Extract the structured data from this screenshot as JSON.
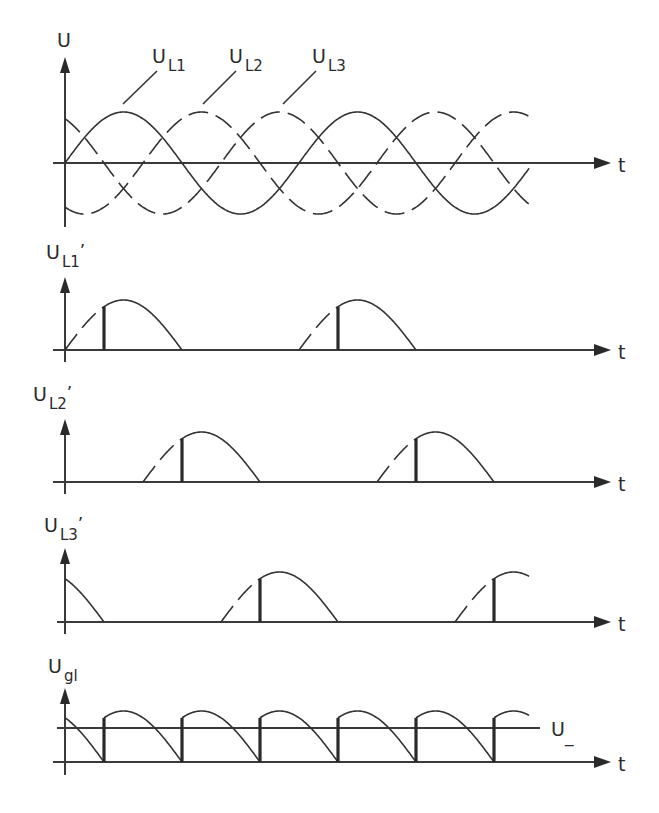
{
  "chart_data": {
    "type": "line",
    "time_axis_label": "t",
    "period_px": 234,
    "origin_x_px": 65,
    "phase_shift_deg": [
      0,
      120,
      240
    ],
    "firing_angle_deg": 60,
    "panels": [
      {
        "id": "phase-voltages",
        "ylabel": "U",
        "series": [
          {
            "name": "U_L1",
            "label_main": "U",
            "label_sub": "L1",
            "style": "solid",
            "shift_deg": 0
          },
          {
            "name": "U_L2",
            "label_main": "U",
            "label_sub": "L2",
            "style": "dashed",
            "shift_deg": 120
          },
          {
            "name": "U_L3",
            "label_main": "U",
            "label_sub": "L3",
            "style": "dashed",
            "shift_deg": 240
          }
        ],
        "x_range_deg": [
          0,
          715
        ],
        "baseline_y": 163,
        "amplitude": 51
      },
      {
        "id": "UL1-prime",
        "ylabel_main": "U",
        "ylabel_sub": "L1",
        "ylabel_prime": "’",
        "shift_deg": 0,
        "baseline_y": 350,
        "amplitude": 50,
        "conduction_deg": [
          [
            60,
            180
          ],
          [
            420,
            540
          ]
        ],
        "dashed_lead_deg": [
          [
            0,
            60
          ],
          [
            360,
            420
          ]
        ]
      },
      {
        "id": "UL2-prime",
        "ylabel_main": "U",
        "ylabel_sub": "L2",
        "ylabel_prime": "’",
        "shift_deg": 120,
        "baseline_y": 482,
        "amplitude": 50,
        "conduction_deg": [
          [
            180,
            300
          ],
          [
            540,
            660
          ]
        ],
        "dashed_lead_deg": [
          [
            120,
            180
          ],
          [
            480,
            540
          ]
        ]
      },
      {
        "id": "UL3-prime",
        "ylabel_main": "U",
        "ylabel_sub": "L3",
        "ylabel_prime": "’",
        "shift_deg": 240,
        "baseline_y": 622,
        "amplitude": 50,
        "conduction_deg": [
          [
            0,
            60
          ],
          [
            300,
            420
          ],
          [
            660,
            715
          ]
        ],
        "dashed_lead_deg": [
          [
            240,
            300
          ],
          [
            600,
            660
          ]
        ]
      },
      {
        "id": "Ugl",
        "ylabel_main": "U",
        "ylabel_sub": "gl",
        "baseline_y": 762,
        "amplitude": 51,
        "mean_line_y": 728,
        "mean_label": "U_",
        "segments_deg": [
          {
            "shift": 240,
            "from": 0,
            "to": 60
          },
          {
            "shift": 0,
            "from": 60,
            "to": 180
          },
          {
            "shift": 120,
            "from": 180,
            "to": 300
          },
          {
            "shift": 240,
            "from": 300,
            "to": 420
          },
          {
            "shift": 0,
            "from": 420,
            "to": 540
          },
          {
            "shift": 120,
            "from": 540,
            "to": 660
          },
          {
            "shift": 240,
            "from": 660,
            "to": 715
          }
        ]
      }
    ],
    "grid": false,
    "legend": "leader-line labels"
  },
  "labels": {
    "t": "t",
    "U": "U",
    "U_main": "U",
    "L1": "L1",
    "L2": "L2",
    "L3": "L3",
    "gl": "gl",
    "prime": "’",
    "mean": "U_"
  }
}
